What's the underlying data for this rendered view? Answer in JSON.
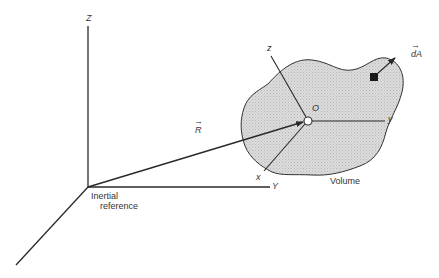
{
  "diagram": {
    "type": "control volume in inertial reference frame",
    "colors": {
      "line": "#2a2a2a",
      "volume_fill": "#d4d4d4",
      "volume_stroke": "#333333",
      "text": "#333333",
      "background": "#ffffff"
    },
    "inertial_frame": {
      "label": "Inertial reference",
      "label_line1": "Inertial",
      "label_line2": "reference",
      "axes": {
        "Z": "Z",
        "Y": "Y"
      }
    },
    "position_vector": {
      "label": "R",
      "arrow_glyph": "→"
    },
    "body_frame": {
      "origin_label": "O",
      "axes": {
        "x": "x",
        "y": "y",
        "z": "z"
      }
    },
    "volume": {
      "label": "Volume"
    },
    "area_element": {
      "label": "dA",
      "arrow_glyph": "→"
    }
  }
}
